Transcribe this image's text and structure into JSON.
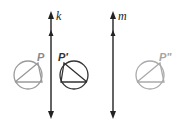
{
  "diagram": {
    "lines": [
      {
        "id": "k",
        "label": "k",
        "x": 51,
        "y1": 13,
        "y2": 117,
        "color": "#222222"
      },
      {
        "id": "m",
        "label": "m",
        "x": 113,
        "y1": 13,
        "y2": 117,
        "color": "#222222"
      }
    ],
    "figures": [
      {
        "id": "P",
        "label": "P",
        "cx": 28,
        "cy": 75,
        "r": 14,
        "color": "#9a9a9a",
        "orientation": "original"
      },
      {
        "id": "P1",
        "label": "P'",
        "cx": 74,
        "cy": 75,
        "r": 14,
        "color": "#333333",
        "orientation": "reflected"
      },
      {
        "id": "P2",
        "label": "P\"",
        "cx": 150,
        "cy": 75,
        "r": 14,
        "color": "#aaaaaa",
        "orientation": "original"
      }
    ]
  }
}
